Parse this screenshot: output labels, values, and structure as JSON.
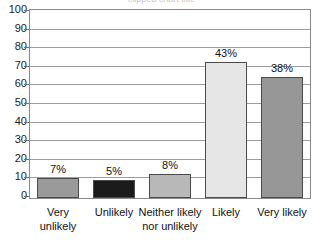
{
  "chart_data": {
    "type": "bar",
    "title": "",
    "xlabel": "",
    "ylabel": "",
    "categories": [
      "Very unlikely",
      "Unlikely",
      "Neither likely nor unlikely",
      "Likely",
      "Very likely"
    ],
    "category_lines": [
      [
        "Very",
        "unlikely"
      ],
      [
        "Unlikely",
        ""
      ],
      [
        "Neither likely",
        "nor unlikely"
      ],
      [
        "Likely",
        ""
      ],
      [
        "Very likely",
        ""
      ]
    ],
    "values": [
      11,
      9.5,
      13,
      73,
      65
    ],
    "data_labels": [
      "7%",
      "5%",
      "8%",
      "43%",
      "38%"
    ],
    "label_percents": [
      7,
      5,
      8,
      43,
      38
    ],
    "ylim": [
      0,
      100
    ],
    "yticks": [
      100,
      90,
      80,
      70,
      60,
      50,
      40,
      30,
      20,
      10,
      0
    ],
    "grid": true,
    "legend": "none",
    "bar_colors": [
      "#9a9a9a",
      "#1b1b1b",
      "#b8b8b8",
      "#e6e6e6",
      "#979797"
    ],
    "bar_outline": "#4a4a4a",
    "gridline_color": "#9c9c9c",
    "axis_color": "#8a8a8a",
    "text_color": "#111111",
    "background": "#ffffff"
  },
  "title_remnant": "clipped chart title"
}
